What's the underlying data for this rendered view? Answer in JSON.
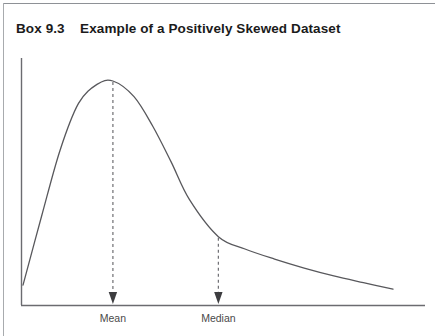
{
  "figure": {
    "number_label": "Box 9.3",
    "title": "Example of a Positively Skewed Dataset",
    "full_title": "Box 9.3    Example of a Positively Skewed Dataset"
  },
  "colors": {
    "curve": "#58585c",
    "axis": "#6b6b70",
    "dashed_guide": "#6e6e73",
    "title_text": "#1b1b1b",
    "label_text": "#4a4a4a",
    "border": "#8e9196",
    "background": "#ffffff"
  },
  "annotations": {
    "mean": {
      "label": "Mean",
      "marker": "down-arrow",
      "guide": "dashed-vertical"
    },
    "median": {
      "label": "Median",
      "marker": "down-arrow",
      "guide": "dashed-vertical"
    }
  },
  "chart_data": {
    "type": "line",
    "title": "Example of a Positively Skewed Dataset",
    "subtitle": "Box 9.3",
    "xlabel": "",
    "ylabel": "",
    "grid": false,
    "legend": null,
    "axes": {
      "y_axis_visible": true,
      "x_axis_visible": true,
      "tick_labels_x": [
        "Mean",
        "Median"
      ],
      "tick_labels_y": []
    },
    "annotations": [
      {
        "name": "Mean",
        "x": 0.243,
        "y_on_curve": 1.0
      },
      {
        "name": "Median",
        "x": 0.528,
        "y_on_curve": 0.305
      }
    ],
    "x": [
      0.0,
      0.05,
      0.1,
      0.15,
      0.2,
      0.243,
      0.3,
      0.35,
      0.4,
      0.45,
      0.528,
      0.6,
      0.68,
      0.76,
      0.84,
      0.92,
      1.0
    ],
    "y": [
      0.089,
      0.395,
      0.69,
      0.9,
      0.985,
      1.0,
      0.93,
      0.8,
      0.64,
      0.47,
      0.305,
      0.25,
      0.205,
      0.165,
      0.13,
      0.1,
      0.071
    ],
    "series": [
      {
        "name": "Positively skewed distribution",
        "x": [
          0.0,
          0.05,
          0.1,
          0.15,
          0.2,
          0.243,
          0.3,
          0.35,
          0.4,
          0.45,
          0.528,
          0.6,
          0.68,
          0.76,
          0.84,
          0.92,
          1.0
        ],
        "values": [
          0.089,
          0.395,
          0.69,
          0.9,
          0.985,
          1.0,
          0.93,
          0.8,
          0.64,
          0.47,
          0.305,
          0.25,
          0.205,
          0.165,
          0.13,
          0.1,
          0.071
        ]
      }
    ],
    "xlim": [
      0,
      1
    ],
    "ylim": [
      0,
      1
    ]
  }
}
